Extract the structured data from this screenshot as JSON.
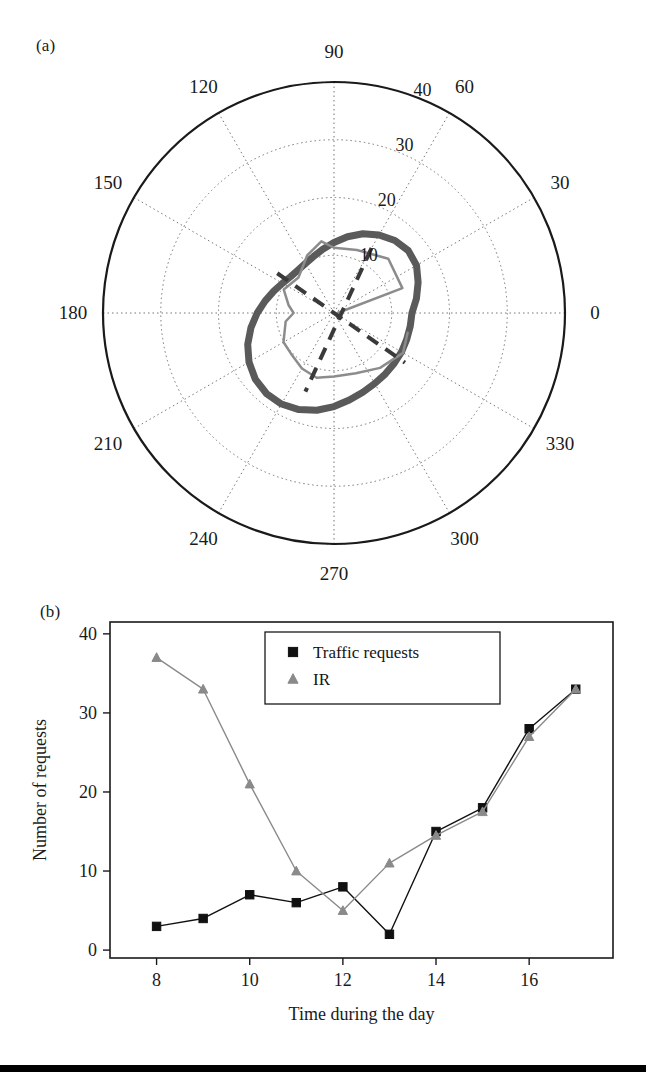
{
  "figure": {
    "panel_a_tag": "(a)",
    "panel_b_tag": "(b)"
  },
  "chart_data": [
    {
      "type": "line",
      "subtype": "polar",
      "panel": "(a)",
      "title": "",
      "angle_unit": "degrees",
      "angle_ticks": [
        0,
        30,
        60,
        90,
        120,
        150,
        180,
        210,
        240,
        270,
        300,
        330
      ],
      "angle_tick_labels": [
        "0",
        "30",
        "60",
        "90",
        "120",
        "150",
        "180",
        "210",
        "240",
        "270",
        "300",
        "330"
      ],
      "radial_ticks": [
        10,
        20,
        30,
        40
      ],
      "radial_tick_labels": [
        "10",
        "20",
        "30",
        "40"
      ],
      "rlim": [
        0,
        40
      ],
      "grid": true,
      "theta_zero_location": "E",
      "theta_direction": "counterclockwise",
      "series": [
        {
          "name": "ellipse-envelope",
          "style": "solid-thick",
          "color": "#5a5a5a",
          "linewidth": 7,
          "description": "Thick grey ellipse centred off-origin, major axis oriented toward 330 degrees",
          "points_polar": [
            {
              "theta": 0,
              "r": 13.5
            },
            {
              "theta": 10,
              "r": 14.5
            },
            {
              "theta": 20,
              "r": 15.5
            },
            {
              "theta": 30,
              "r": 16.5
            },
            {
              "theta": 40,
              "r": 16.8
            },
            {
              "theta": 50,
              "r": 16.4
            },
            {
              "theta": 60,
              "r": 15.6
            },
            {
              "theta": 70,
              "r": 14.6
            },
            {
              "theta": 80,
              "r": 13.4
            },
            {
              "theta": 90,
              "r": 12.2
            },
            {
              "theta": 100,
              "r": 11.2
            },
            {
              "theta": 110,
              "r": 10.4
            },
            {
              "theta": 120,
              "r": 9.9
            },
            {
              "theta": 130,
              "r": 9.7
            },
            {
              "theta": 140,
              "r": 9.8
            },
            {
              "theta": 150,
              "r": 10.3
            },
            {
              "theta": 160,
              "r": 11.1
            },
            {
              "theta": 170,
              "r": 12.1
            },
            {
              "theta": 180,
              "r": 13.3
            },
            {
              "theta": 190,
              "r": 14.6
            },
            {
              "theta": 200,
              "r": 15.9
            },
            {
              "theta": 210,
              "r": 17.0
            },
            {
              "theta": 220,
              "r": 17.8
            },
            {
              "theta": 230,
              "r": 18.2
            },
            {
              "theta": 240,
              "r": 18.2
            },
            {
              "theta": 250,
              "r": 17.8
            },
            {
              "theta": 260,
              "r": 17.1
            },
            {
              "theta": 270,
              "r": 16.2
            },
            {
              "theta": 280,
              "r": 15.3
            },
            {
              "theta": 290,
              "r": 14.6
            },
            {
              "theta": 300,
              "r": 14.1
            },
            {
              "theta": 310,
              "r": 13.8
            },
            {
              "theta": 320,
              "r": 13.6
            },
            {
              "theta": 330,
              "r": 13.5
            },
            {
              "theta": 340,
              "r": 13.4
            },
            {
              "theta": 350,
              "r": 13.4
            },
            {
              "theta": 360,
              "r": 13.5
            }
          ]
        },
        {
          "name": "measured-profile",
          "style": "solid-thin",
          "color": "#8c8c8c",
          "linewidth": 2.5,
          "description": "Thin grey polyline radiating from centre with angular segments",
          "points_polar": [
            {
              "theta": 0,
              "r": 0.6
            },
            {
              "theta": 20,
              "r": 12.6
            },
            {
              "theta": 45,
              "r": 13.3
            },
            {
              "theta": 70,
              "r": 11.6
            },
            {
              "theta": 90,
              "r": 11.3
            },
            {
              "theta": 100,
              "r": 12.6
            },
            {
              "theta": 115,
              "r": 11.0
            },
            {
              "theta": 135,
              "r": 8.7
            },
            {
              "theta": 155,
              "r": 9.6
            },
            {
              "theta": 170,
              "r": 8.0
            },
            {
              "theta": 180,
              "r": 7.0
            },
            {
              "theta": 190,
              "r": 8.5
            },
            {
              "theta": 210,
              "r": 10.1
            },
            {
              "theta": 225,
              "r": 10.3
            },
            {
              "theta": 240,
              "r": 11.1
            },
            {
              "theta": 255,
              "r": 11.6
            },
            {
              "theta": 270,
              "r": 11.0
            },
            {
              "theta": 290,
              "r": 11.1
            },
            {
              "theta": 310,
              "r": 12.4
            },
            {
              "theta": 330,
              "r": 13.8
            },
            {
              "theta": 345,
              "r": 13.2
            }
          ]
        },
        {
          "name": "reference-axes",
          "style": "dashed",
          "color": "#3a3a3a",
          "linewidth": 4,
          "description": "Two dark dashed chords crossing inside the ellipse",
          "chords_polar": [
            [
              {
                "theta": 145,
                "r": 12.0
              },
              {
                "theta": 325,
                "r": 15.0
              }
            ],
            [
              {
                "theta": 60,
                "r": 13.0
              },
              {
                "theta": 250,
                "r": 14.5
              }
            ]
          ]
        }
      ]
    },
    {
      "type": "line",
      "panel": "(b)",
      "title": "",
      "xlabel": "Time during the day",
      "ylabel": "Number of requests",
      "xlim": [
        7,
        17.8
      ],
      "ylim": [
        -1,
        41.5
      ],
      "xticks": [
        8,
        10,
        12,
        14,
        16
      ],
      "xtick_labels": [
        "8",
        "10",
        "12",
        "14",
        "16"
      ],
      "yticks": [
        0,
        10,
        20,
        30,
        40
      ],
      "ytick_labels": [
        "0",
        "10",
        "20",
        "30",
        "40"
      ],
      "grid": false,
      "legend_position": "upper center",
      "x": [
        8,
        9,
        10,
        11,
        12,
        13,
        14,
        15,
        16,
        17
      ],
      "series": [
        {
          "name": "Traffic requests",
          "marker": "square",
          "color": "#111111",
          "values": [
            3,
            4,
            7,
            6,
            8,
            2,
            15,
            18,
            28,
            33
          ]
        },
        {
          "name": "IR",
          "marker": "triangle",
          "color": "#8a8a8a",
          "values": [
            37,
            33,
            21,
            10,
            5,
            11,
            14.5,
            17.5,
            27,
            33
          ]
        }
      ]
    }
  ]
}
